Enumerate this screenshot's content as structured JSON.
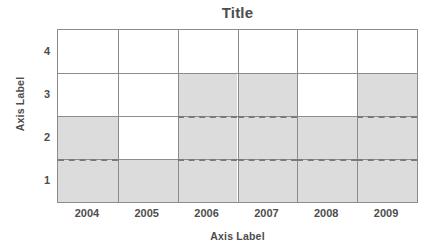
{
  "chart_data": {
    "type": "bar",
    "title": "Title",
    "xlabel": "Axis Label",
    "ylabel": "Axis Label",
    "categories": [
      "2004",
      "2005",
      "2006",
      "2007",
      "2008",
      "2009"
    ],
    "values": [
      2.5,
      1.5,
      3.5,
      3.5,
      2.5,
      3.5
    ],
    "ylim": [
      0.5,
      4.5
    ],
    "ytick_labels": [
      "1",
      "2",
      "3",
      "4"
    ],
    "ytick_values": [
      1,
      2,
      3,
      4
    ],
    "grid": true,
    "gridline_values": [
      1.5,
      2.5,
      3.5
    ],
    "legend": "none",
    "annotations": [
      {
        "type": "dashed-reference-line",
        "value": 1.5
      },
      {
        "type": "dashed-reference-line",
        "value": 2.5
      }
    ],
    "series": [
      {
        "name": "shaded-level",
        "values": [
          2.5,
          1.5,
          3.5,
          3.5,
          2.5,
          3.5
        ]
      }
    ],
    "colors": {
      "fill": "#dcdcdc",
      "grid": "#8c8c8c",
      "text": "#4d4d4d",
      "dash": "#7a7a7a",
      "background": "#ffffff"
    }
  }
}
